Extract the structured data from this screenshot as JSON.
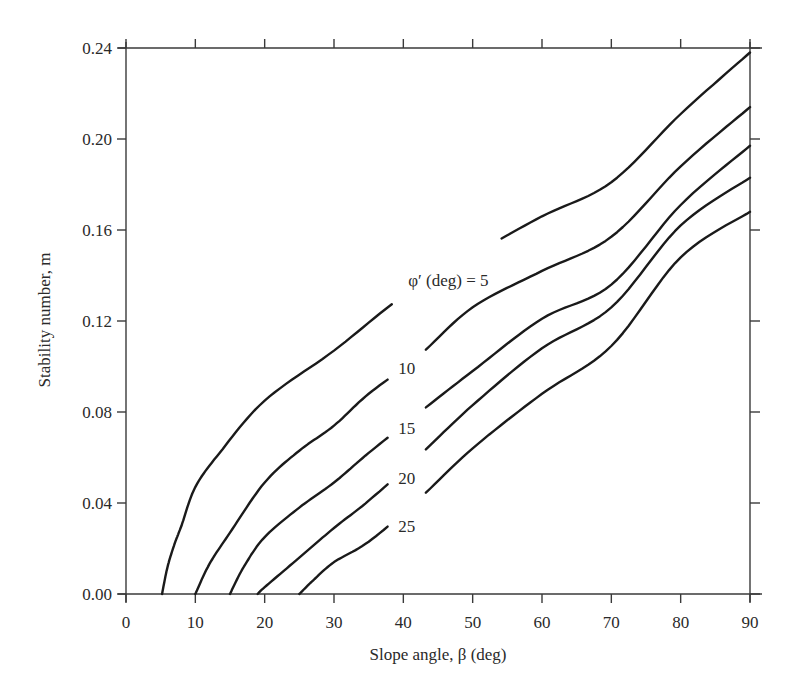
{
  "chart_data": {
    "type": "line",
    "title": "",
    "xlabel": "Slope angle, β (deg)",
    "ylabel": "Stability number, m",
    "xlim": [
      0,
      90
    ],
    "ylim": [
      0.0,
      0.24
    ],
    "grid": false,
    "legend_position": "inline labels",
    "x_ticks": [
      0,
      10,
      20,
      30,
      40,
      50,
      60,
      70,
      80,
      90
    ],
    "x_tick_labels": [
      "0",
      "10",
      "20",
      "30",
      "40",
      "50",
      "60",
      "70",
      "80",
      "90"
    ],
    "y_ticks": [
      0.0,
      0.04,
      0.08,
      0.12,
      0.16,
      0.2,
      0.24
    ],
    "y_tick_labels": [
      "0.00",
      "0.04",
      "0.08",
      "0.12",
      "0.16",
      "0.20",
      "0.24"
    ],
    "series": [
      {
        "name": "φ′ (deg) = 5",
        "label": "φ′ (deg) = 5",
        "phi": 5,
        "x": [
          5.2,
          6,
          7,
          8,
          10,
          13.5,
          20,
          30,
          40,
          50,
          60,
          70,
          80,
          90
        ],
        "y": [
          0.0,
          0.012,
          0.022,
          0.03,
          0.047,
          0.062,
          0.085,
          0.107,
          0.131,
          0.149,
          0.166,
          0.181,
          0.211,
          0.238
        ],
        "label_at": {
          "x": 46.5,
          "y": 0.138
        },
        "gap": [
          38.5,
          53.5
        ]
      },
      {
        "name": "10",
        "label": "10",
        "phi": 10,
        "x": [
          10,
          12,
          15,
          20,
          25,
          30,
          35,
          42,
          50,
          60,
          70,
          80,
          90
        ],
        "y": [
          0.0,
          0.013,
          0.027,
          0.049,
          0.063,
          0.074,
          0.088,
          0.104,
          0.126,
          0.142,
          0.157,
          0.188,
          0.214
        ],
        "label_at": {
          "x": 40.5,
          "y": 0.0995
        },
        "gap": [
          37.8,
          42.8
        ]
      },
      {
        "name": "15",
        "label": "15",
        "phi": 15,
        "x": [
          15,
          17,
          20,
          25,
          30,
          35,
          42,
          50,
          60,
          70,
          80,
          90
        ],
        "y": [
          0.0,
          0.012,
          0.025,
          0.038,
          0.049,
          0.062,
          0.079,
          0.098,
          0.121,
          0.136,
          0.171,
          0.197
        ],
        "label_at": {
          "x": 40.5,
          "y": 0.073
        },
        "gap": [
          37.8,
          42.8
        ]
      },
      {
        "name": "20",
        "label": "20",
        "phi": 20,
        "x": [
          19,
          20,
          25,
          30,
          35,
          42,
          50,
          60,
          70,
          80,
          90
        ],
        "y": [
          0.0,
          0.003,
          0.016,
          0.029,
          0.041,
          0.06,
          0.083,
          0.108,
          0.126,
          0.162,
          0.183
        ],
        "label_at": {
          "x": 40.5,
          "y": 0.051
        },
        "gap": [
          37.8,
          42.8
        ]
      },
      {
        "name": "25",
        "label": "25",
        "phi": 25,
        "x": [
          25,
          27,
          30,
          35,
          42,
          50,
          60,
          70,
          80,
          90
        ],
        "y": [
          0.0,
          0.006,
          0.014,
          0.023,
          0.041,
          0.064,
          0.088,
          0.109,
          0.148,
          0.168
        ],
        "label_at": {
          "x": 40.5,
          "y": 0.03
        },
        "gap": [
          37.8,
          42.8
        ]
      }
    ]
  },
  "colors": {
    "axis": "#3a3a3a",
    "curve": "#1a1a1a",
    "text": "#2a2a2a",
    "background": "#ffffff"
  }
}
